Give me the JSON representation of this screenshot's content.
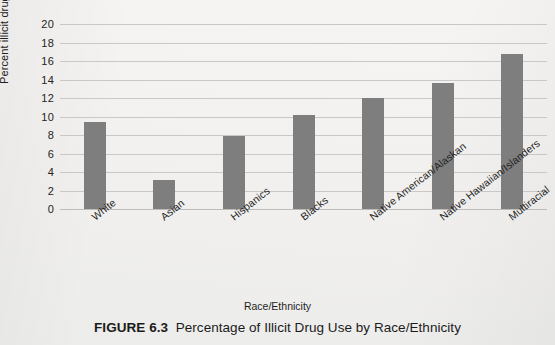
{
  "figure": {
    "number_label": "FIGURE 6.3",
    "title": "Percentage of Illicit Drug Use by Race/Ethnicity"
  },
  "chart_data": {
    "type": "bar",
    "title": "",
    "xlabel": "Race/Ethnicity",
    "ylabel": "Percent illicit drug use",
    "categories": [
      "White",
      "Asian",
      "Hispanics",
      "Blacks",
      "Native American/Alaskan",
      "Native Hawaiian/Islanders",
      "Multiracial"
    ],
    "values": [
      9.4,
      3.1,
      7.9,
      10.2,
      12.0,
      13.6,
      16.8
    ],
    "ylim": [
      0,
      20
    ],
    "ytick_step": 2,
    "ytick_labels": [
      "0",
      "2",
      "4",
      "6",
      "8",
      "10",
      "12",
      "14",
      "16",
      "18",
      "20"
    ],
    "grid": true,
    "grid_axis": "y",
    "legend": "none",
    "bar_color": "#7e7e7e",
    "gridline_color": "#c9c8c6",
    "background_color": "#f1f0ee"
  }
}
